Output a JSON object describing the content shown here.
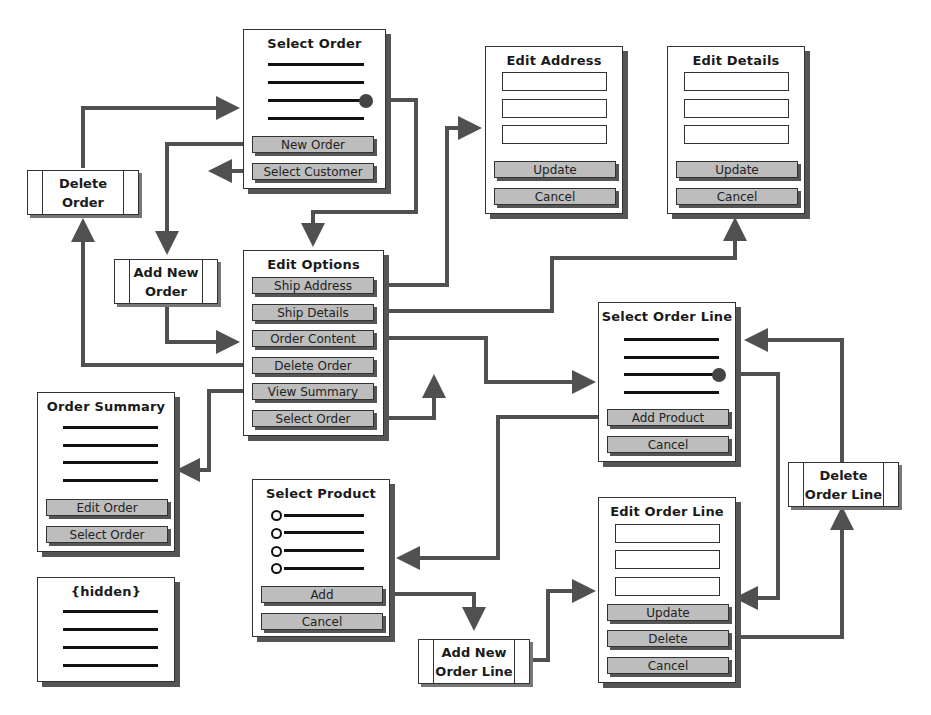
{
  "screens": {
    "select_order": {
      "title": "Select Order",
      "buttons": [
        "New Order",
        "Select Customer"
      ]
    },
    "edit_address": {
      "title": "Edit Address",
      "buttons": [
        "Update",
        "Cancel"
      ]
    },
    "edit_details": {
      "title": "Edit Details",
      "buttons": [
        "Update",
        "Cancel"
      ]
    },
    "edit_options": {
      "title": "Edit Options",
      "buttons": [
        "Ship Address",
        "Ship Details",
        "Order Content",
        "Delete Order",
        "View Summary",
        "Select Order"
      ]
    },
    "select_order_line": {
      "title": "Select Order Line",
      "buttons": [
        "Add Product",
        "Cancel"
      ]
    },
    "order_summary": {
      "title": "Order Summary",
      "buttons": [
        "Edit Order",
        "Select Order"
      ]
    },
    "hidden": {
      "title": "{hidden}"
    },
    "select_product": {
      "title": "Select Product",
      "buttons": [
        "Add",
        "Cancel"
      ]
    },
    "edit_order_line": {
      "title": "Edit Order Line",
      "buttons": [
        "Update",
        "Delete",
        "Cancel"
      ]
    }
  },
  "processes": {
    "delete_order": "Delete\nOrder",
    "add_new_order": "Add New\nOrder",
    "delete_order_line": "Delete\nOrder Line",
    "add_new_order_line": "Add New\nOrder Line"
  },
  "colors": {
    "wire": "#505050",
    "button": "#bdbdbd",
    "shadow": "#555555"
  }
}
